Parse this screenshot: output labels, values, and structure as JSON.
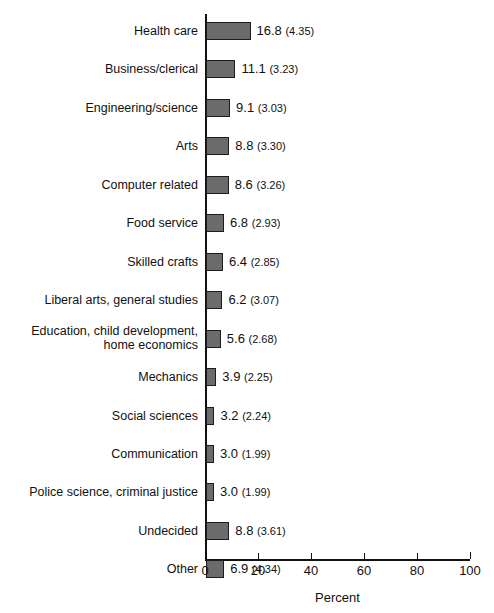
{
  "chart_data": {
    "type": "bar",
    "orientation": "horizontal",
    "title": "",
    "xlabel": "Percent",
    "ylabel": "",
    "xlim": [
      0,
      100
    ],
    "xticks": [
      0,
      20,
      40,
      60,
      80,
      100
    ],
    "xtick_labels": [
      "0",
      "20",
      "40",
      "60",
      "80",
      "100"
    ],
    "grid": false,
    "legend": null,
    "bar_color": "#6b6b6b",
    "bar_edge_color": "#1c1c1c",
    "axis_color": "#111111",
    "value_label_format": "value (standard_error)",
    "categories": [
      "Health care",
      "Business/clerical",
      "Engineering/science",
      "Arts",
      "Computer related",
      "Food service",
      "Skilled crafts",
      "Liberal arts, general studies",
      "Education, child development,\nhome economics",
      "Mechanics",
      "Social sciences",
      "Communication",
      "Police science, criminal justice",
      "Undecided",
      "Other"
    ],
    "values": [
      16.8,
      11.1,
      9.1,
      8.8,
      8.6,
      6.8,
      6.4,
      6.2,
      5.6,
      3.9,
      3.2,
      3.0,
      3.0,
      8.8,
      6.9
    ],
    "errors": [
      4.35,
      3.23,
      3.03,
      3.3,
      3.26,
      2.93,
      2.85,
      3.07,
      2.68,
      2.25,
      2.24,
      1.99,
      1.99,
      3.61,
      4.34
    ],
    "rows": [
      {
        "label": "Health care",
        "value": 16.8,
        "value_text": "16.8",
        "error_text": "(4.35)"
      },
      {
        "label": "Business/clerical",
        "value": 11.1,
        "value_text": "11.1",
        "error_text": "(3.23)"
      },
      {
        "label": "Engineering/science",
        "value": 9.1,
        "value_text": "9.1",
        "error_text": "(3.03)"
      },
      {
        "label": "Arts",
        "value": 8.8,
        "value_text": "8.8",
        "error_text": "(3.30)"
      },
      {
        "label": "Computer related",
        "value": 8.6,
        "value_text": "8.6",
        "error_text": "(3.26)"
      },
      {
        "label": "Food service",
        "value": 6.8,
        "value_text": "6.8",
        "error_text": "(2.93)"
      },
      {
        "label": "Skilled crafts",
        "value": 6.4,
        "value_text": "6.4",
        "error_text": "(2.85)"
      },
      {
        "label": "Liberal arts, general studies",
        "value": 6.2,
        "value_text": "6.2",
        "error_text": "(3.07)"
      },
      {
        "label": "Education, child development,\nhome economics",
        "value": 5.6,
        "value_text": "5.6",
        "error_text": "(2.68)"
      },
      {
        "label": "Mechanics",
        "value": 3.9,
        "value_text": "3.9",
        "error_text": "(2.25)"
      },
      {
        "label": "Social sciences",
        "value": 3.2,
        "value_text": "3.2",
        "error_text": "(2.24)"
      },
      {
        "label": "Communication",
        "value": 3.0,
        "value_text": "3.0",
        "error_text": "(1.99)"
      },
      {
        "label": "Police science, criminal justice",
        "value": 3.0,
        "value_text": "3.0",
        "error_text": "(1.99)"
      },
      {
        "label": "Undecided",
        "value": 8.8,
        "value_text": "8.8",
        "error_text": "(3.61)"
      },
      {
        "label": "Other",
        "value": 6.9,
        "value_text": "6.9",
        "error_text": "(4.34)"
      }
    ]
  }
}
